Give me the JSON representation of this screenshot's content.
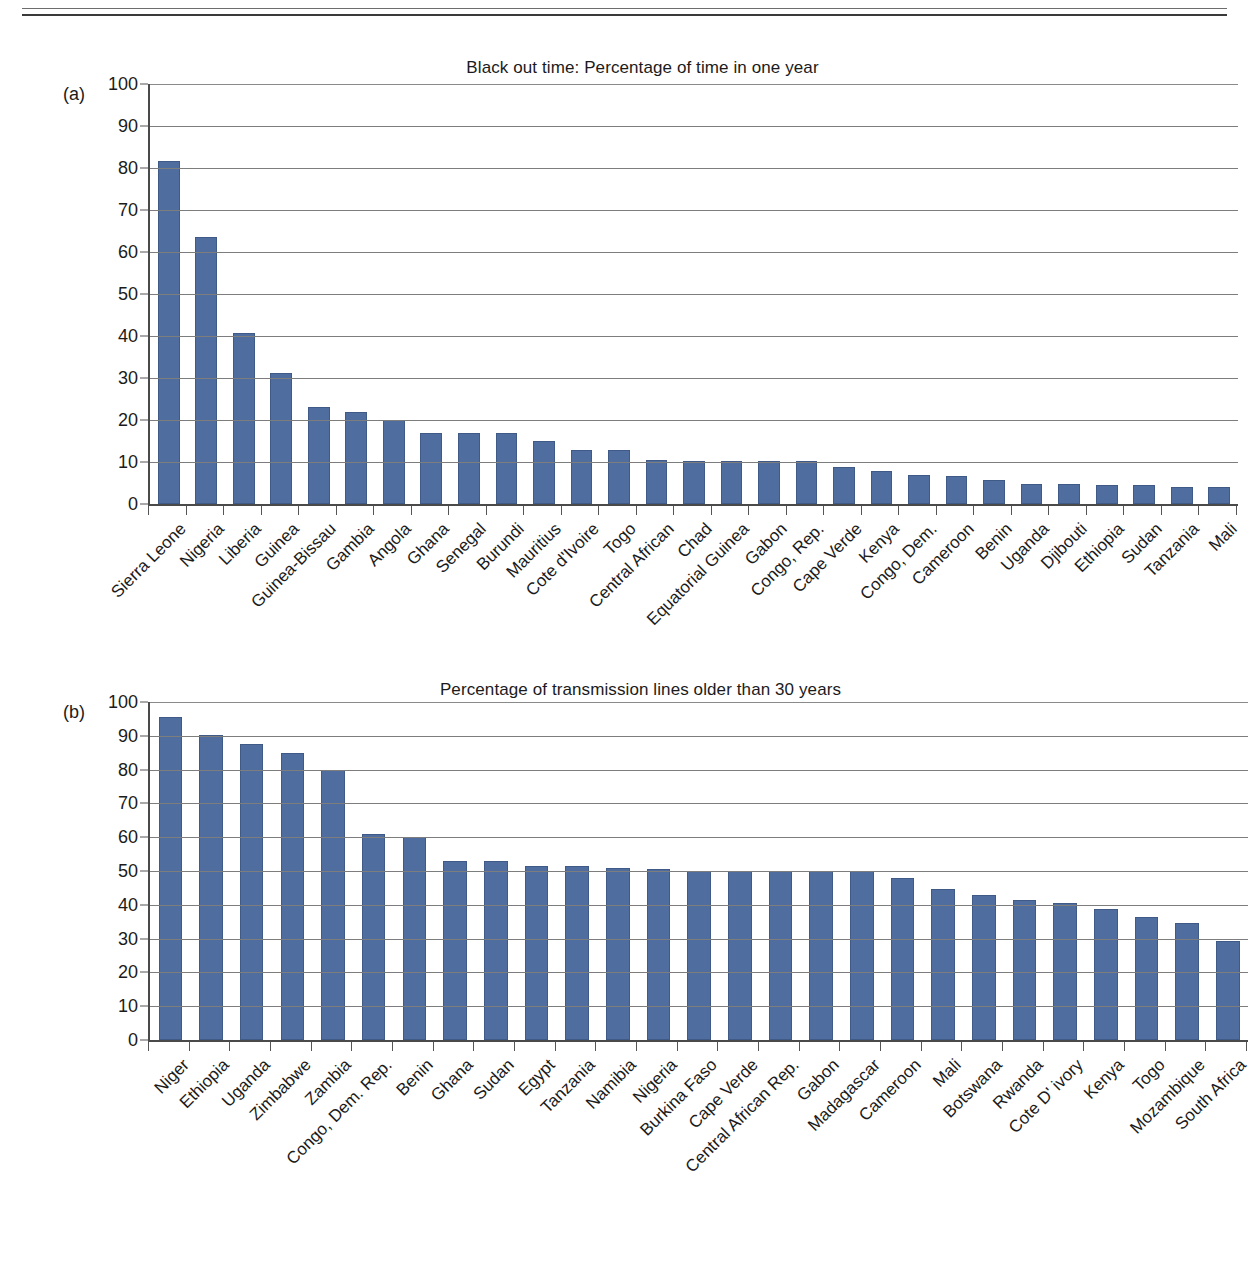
{
  "page": {
    "header_clipped_text": ""
  },
  "figures": [
    {
      "panel_letter": "(a)",
      "title": "Black out time: Percentage of time in one year"
    },
    {
      "panel_letter": "(b)",
      "title": "Percentage of transmission lines older than 30 years"
    }
  ],
  "colors": {
    "bar_fill": "#4f6d9e",
    "bar_stroke": "#3f5a86",
    "axis": "#4a4a4a",
    "gridline": "#7d7d7d",
    "text": "#1b1b1b"
  },
  "chart_data": [
    {
      "type": "bar",
      "panel": "(a)",
      "title": "Black out time: Percentage of time in one year",
      "xlabel": "",
      "ylabel": "",
      "ylim": [
        0,
        100
      ],
      "yticks": [
        0,
        10,
        20,
        30,
        40,
        50,
        60,
        70,
        80,
        90,
        100
      ],
      "grid": true,
      "legend": "none",
      "categories": [
        "Sierra Leone",
        "Nigeria",
        "Liberia",
        "Guinea",
        "Guinea-Bissau",
        "Gambia",
        "Angola",
        "Ghana",
        "Senegal",
        "Burundi",
        "Mauritius",
        "Cote d'Ivoire",
        "Togo",
        "Central African",
        "Chad",
        "Equatorial Guinea",
        "Gabon",
        "Congo, Rep.",
        "Cape Verde",
        "Kenya",
        "Congo, Dem.",
        "Cameroon",
        "Benin",
        "Uganda",
        "Djibouti",
        "Ethiopia",
        "Sudan",
        "Tanzania",
        "Mali"
      ],
      "values": [
        81.7,
        63.5,
        40.8,
        31.2,
        23.0,
        21.8,
        20.0,
        16.8,
        16.8,
        16.8,
        15.0,
        12.8,
        12.8,
        10.4,
        10.3,
        10.3,
        10.3,
        10.3,
        8.7,
        7.8,
        6.9,
        6.7,
        5.6,
        4.8,
        4.7,
        4.6,
        4.5,
        4.1,
        4.1
      ]
    },
    {
      "type": "bar",
      "panel": "(b)",
      "title": "Percentage of transmission lines older than 30 years",
      "xlabel": "",
      "ylabel": "",
      "ylim": [
        0,
        100
      ],
      "yticks": [
        0,
        10,
        20,
        30,
        40,
        50,
        60,
        70,
        80,
        90,
        100
      ],
      "grid": true,
      "legend": "none",
      "categories": [
        "Niger",
        "Ethiopia",
        "Uganda",
        "Zimbabwe",
        "Zambia",
        "Congo, Dem. Rep.",
        "Benin",
        "Ghana",
        "Sudan",
        "Egypt",
        "Tanzania",
        "Namibia",
        "Nigeria",
        "Burkina Faso",
        "Cape Verde",
        "Central African Rep.",
        "Gabon",
        "Madagascar",
        "Cameroon",
        "Mali",
        "Botswana",
        "Rwanda",
        "Cote D' ivory",
        "Kenya",
        "Togo",
        "Mozambique",
        "South Africa"
      ],
      "values": [
        95.5,
        90.3,
        87.7,
        85.0,
        80.0,
        61.0,
        60.2,
        53.0,
        53.0,
        51.5,
        51.4,
        50.8,
        50.6,
        50.0,
        50.0,
        50.0,
        50.0,
        50.0,
        48.0,
        44.8,
        43.0,
        41.5,
        40.5,
        38.7,
        36.3,
        34.5,
        29.3
      ]
    }
  ]
}
